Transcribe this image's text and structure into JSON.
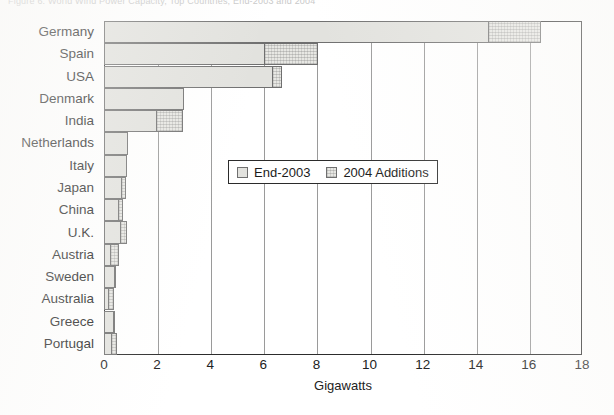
{
  "figure": {
    "caption": "Figure 6.  World Wind Power Capacity, Top Countries, End-2003 and 2004"
  },
  "chart_data": {
    "type": "bar",
    "orientation": "horizontal",
    "stacked": true,
    "title": "",
    "xlabel": "Gigawatts",
    "ylabel": "",
    "xlim": [
      0,
      18
    ],
    "xticks": [
      0,
      2,
      4,
      6,
      8,
      10,
      12,
      14,
      16,
      18
    ],
    "xtick_labels": [
      "0",
      "2",
      "4",
      "6",
      "8",
      "10",
      "12",
      "14",
      "16",
      "18"
    ],
    "grid": "vertical",
    "legend_position": "center",
    "categories": [
      "Germany",
      "Spain",
      "USA",
      "Denmark",
      "India",
      "Netherlands",
      "Italy",
      "Japan",
      "China",
      "U.K.",
      "Austria",
      "Sweden",
      "Australia",
      "Greece",
      "Portugal"
    ],
    "series": [
      {
        "name": "End-2003",
        "values": [
          14.5,
          6.05,
          6.35,
          3.0,
          2.0,
          0.9,
          0.87,
          0.68,
          0.57,
          0.65,
          0.28,
          0.4,
          0.2,
          0.38,
          0.3
        ]
      },
      {
        "name": "2004 Additions",
        "values": [
          2.0,
          2.05,
          0.4,
          0.0,
          1.0,
          0.0,
          0.0,
          0.2,
          0.2,
          0.25,
          0.32,
          0.05,
          0.2,
          0.09,
          0.22
        ]
      }
    ],
    "totals": [
      16.5,
      8.1,
      6.65,
      3.0,
      3.0,
      0.9,
      0.87,
      0.88,
      0.77,
      0.9,
      0.6,
      0.45,
      0.4,
      0.47,
      0.52
    ]
  },
  "legend": {
    "entries": [
      {
        "label": "End-2003",
        "swatch": "light-gray-solid",
        "color": "#e2e2de"
      },
      {
        "label": "2004 Additions",
        "swatch": "light-gray-hatched",
        "color": "#e7e7e3"
      }
    ]
  },
  "colors": {
    "frame": "#2c2c2c",
    "grid": "#9a9a9a",
    "bar_base": "#e2e2de",
    "bar_addition": "#e7e7e3",
    "bar_outline": "#6f6f6f",
    "text": "#222222",
    "page": "#ffffff"
  }
}
